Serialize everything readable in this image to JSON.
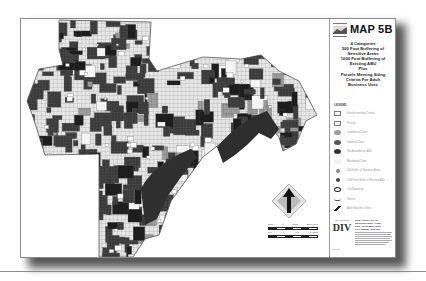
{
  "document": {
    "title": "MAP 5B",
    "subtitle_lines": [
      "4 Categories",
      "500 Foot Buffering of",
      "Sensitive Areas",
      "1000 Foot Buffering of",
      "Existing ABU",
      "Plus",
      "Parcels Meeting Siting",
      "Criteria For Adult",
      "Business Uses"
    ],
    "logo_caption": "TUCSON"
  },
  "legend": {
    "title": "LEGEND",
    "items": [
      {
        "label": "Parcels meeting Criteria",
        "symbol": "box",
        "color": "#ffffff"
      },
      {
        "label": "Parcels",
        "symbol": "box",
        "color": "#ffffff"
      },
      {
        "label": "Commercial Zone",
        "symbol": "oval",
        "color": "#9a9a9a"
      },
      {
        "label": "Industrial Zone",
        "symbol": "oval",
        "color": "#555555"
      },
      {
        "label": "Not Available for ABU",
        "symbol": "oval",
        "color": "#333333"
      },
      {
        "label": "Residential Zone",
        "symbol": "oval",
        "color": "#f2f2f2"
      },
      {
        "label": "500 Buffer of Sensitive Areas",
        "symbol": "dot",
        "color": "#8a8a8a"
      },
      {
        "label": "1000 Foot Buffer of Existing ABU",
        "symbol": "dot",
        "color": "#444444"
      },
      {
        "label": "City Boundary",
        "symbol": "oval-outline",
        "color": "#ffffff"
      },
      {
        "label": "Streets",
        "symbol": "wave",
        "color": "#555555"
      },
      {
        "label": "Adult Business Store",
        "symbol": "pin",
        "color": "#222222"
      }
    ]
  },
  "scale_bar": {
    "top_labels": [
      "1000",
      "0",
      "1000",
      "2000 Feet"
    ],
    "bottom_labels": [
      "0.5",
      "0",
      "0.5",
      "1 Miles"
    ]
  },
  "footer": {
    "logo_caption": "City Planning",
    "logo_mark": "DIV",
    "info_lines": [
      "Data: Parcel, SILOG",
      "California Zone, Pima",
      "Date: September 2001",
      "File: map5b_final.apr"
    ],
    "note": "Map 5B"
  },
  "colors": {
    "ink": "#222222",
    "mid_gray": "#8a8a8a",
    "shadow": "#3a3a3a"
  }
}
